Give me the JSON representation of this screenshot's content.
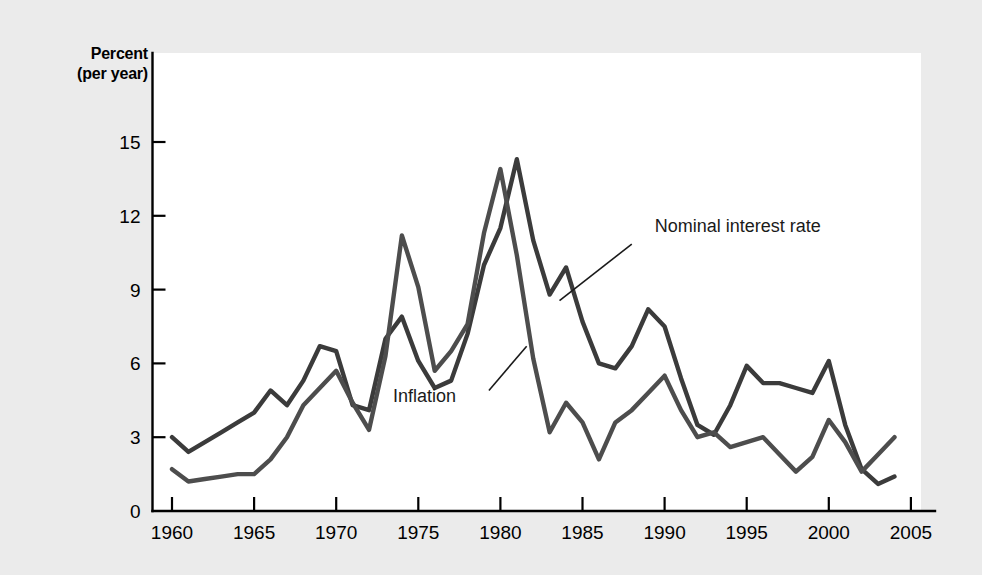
{
  "figure": {
    "y_axis_title_line1": "Percent",
    "y_axis_title_line2": "(per year)"
  },
  "chart_data": {
    "type": "line",
    "title": "",
    "subtitle": "",
    "xlabel": "",
    "ylabel": "Percent (per year)",
    "xlim": [
      1959.4,
      2005.4
    ],
    "ylim": [
      0,
      16.2
    ],
    "xticks": [
      1960,
      1965,
      1970,
      1975,
      1980,
      1985,
      1990,
      1995,
      2000,
      2005
    ],
    "xtick_labels": [
      "1960",
      "1965",
      "1970",
      "1975",
      "1980",
      "1985",
      "1990",
      "1995",
      "2000",
      "2005"
    ],
    "yticks": [
      0,
      3,
      6,
      9,
      12,
      15
    ],
    "ytick_labels": [
      "0",
      "3",
      "6",
      "9",
      "12",
      "15"
    ],
    "grid": false,
    "legend_position": "inline-annotations",
    "x": [
      1960,
      1961,
      1962,
      1963,
      1964,
      1965,
      1966,
      1967,
      1968,
      1969,
      1970,
      1971,
      1972,
      1973,
      1974,
      1975,
      1976,
      1977,
      1978,
      1979,
      1980,
      1981,
      1982,
      1983,
      1984,
      1985,
      1986,
      1987,
      1988,
      1989,
      1990,
      1991,
      1992,
      1993,
      1994,
      1995,
      1996,
      1997,
      1998,
      1999,
      2000,
      2001,
      2002,
      2003,
      2004
    ],
    "series": [
      {
        "name": "Nominal interest rate",
        "color": "#3b3b3b",
        "annotation": "Nominal interest rate",
        "values": [
          3.0,
          2.4,
          2.8,
          3.2,
          3.6,
          4.0,
          4.9,
          4.3,
          5.3,
          6.7,
          6.5,
          4.3,
          4.1,
          7.0,
          7.9,
          6.1,
          5.0,
          5.3,
          7.2,
          10.0,
          11.5,
          14.3,
          11.0,
          8.8,
          9.9,
          7.7,
          6.0,
          5.8,
          6.7,
          8.2,
          7.5,
          5.4,
          3.5,
          3.1,
          4.3,
          5.9,
          5.2,
          5.2,
          5.0,
          4.8,
          6.1,
          3.5,
          1.7,
          1.1,
          1.4
        ]
      },
      {
        "name": "Inflation",
        "color": "#4d4d4d",
        "annotation": "Inflation",
        "values": [
          1.7,
          1.2,
          1.3,
          1.4,
          1.5,
          1.5,
          2.1,
          3.0,
          4.3,
          5.0,
          5.7,
          4.4,
          3.3,
          6.3,
          11.2,
          9.1,
          5.7,
          6.5,
          7.6,
          11.3,
          13.9,
          10.4,
          6.2,
          3.2,
          4.4,
          3.6,
          2.1,
          3.6,
          4.1,
          4.8,
          5.5,
          4.1,
          3.0,
          3.2,
          2.6,
          2.8,
          3.0,
          2.3,
          1.6,
          2.2,
          3.7,
          2.8,
          1.6,
          2.3,
          3.0
        ]
      }
    ],
    "annotations": [
      {
        "text": "Nominal interest rate",
        "label_x": 1989.4,
        "label_y": 11.35,
        "leader_from_x": 1988.0,
        "leader_from_y": 10.85,
        "leader_to_x": 1983.6,
        "leader_to_y": 8.55
      },
      {
        "text": "Inflation",
        "label_x": 1977.3,
        "label_y": 4.45,
        "leader_from_x": 1979.3,
        "leader_from_y": 4.9,
        "leader_to_x": 1981.6,
        "leader_to_y": 6.7
      }
    ]
  }
}
